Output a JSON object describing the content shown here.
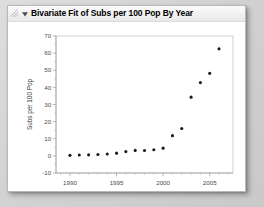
{
  "window": {
    "background_color": "#d6d6d6",
    "card_background": "#ffffff"
  },
  "titlebar": {
    "grip_icon": "resize-grip-icon",
    "disclosure_icon": "disclosure-triangle-open-icon",
    "title": "Bivariate Fit of Subs per 100 Pop By Year"
  },
  "chart_data": {
    "type": "scatter",
    "title": "Bivariate Fit of Subs per 100 Pop By Year",
    "xlabel": "Year",
    "ylabel": "Subs per 100 Pop",
    "xlim": [
      1988.5,
      2007.5
    ],
    "ylim": [
      -10,
      70
    ],
    "xticks": [
      1990,
      1995,
      2000,
      2005
    ],
    "xticklabels": [
      "1990",
      "1995",
      "2000",
      "2005"
    ],
    "yticks": [
      -10,
      0,
      10,
      20,
      30,
      40,
      50,
      60,
      70
    ],
    "yticklabels": [
      "-10",
      "0",
      "10",
      "20",
      "30",
      "40",
      "50",
      "60",
      "70"
    ],
    "grid": false,
    "legend": false,
    "marker": "filled-circle",
    "marker_color": "#1a1a1a",
    "x": [
      1990,
      1991,
      1992,
      1993,
      1994,
      1995,
      1996,
      1997,
      1998,
      1999,
      2000,
      2001,
      2002,
      2003,
      2004,
      2005,
      2006
    ],
    "y": [
      0.3,
      0.5,
      0.6,
      0.8,
      1.1,
      1.6,
      2.5,
      3.2,
      3.1,
      3.6,
      4.5,
      11.8,
      16.0,
      34.3,
      42.8,
      48.2,
      62.5
    ],
    "series": [
      {
        "name": "Subs per 100 Pop",
        "values": [
          0.3,
          0.5,
          0.6,
          0.8,
          1.1,
          1.6,
          2.5,
          3.2,
          3.1,
          3.6,
          4.5,
          11.8,
          16.0,
          34.3,
          42.8,
          48.2,
          62.5
        ]
      }
    ]
  }
}
